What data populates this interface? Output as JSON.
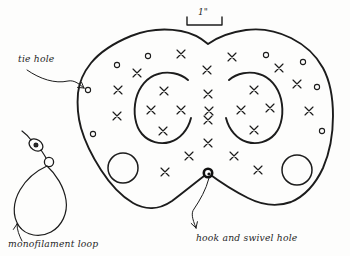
{
  "drawing": {
    "title": "Fishing board / planer board layout sketch",
    "medium": "hand-drawn pencil line art",
    "background_color": "#fdfdfc",
    "ink_color": "#1c1c1c"
  },
  "scale": {
    "label": "1\"",
    "bar_length_px": 35,
    "meaning": "one inch reference bar"
  },
  "labels": [
    {
      "id": "tie-hole",
      "text": "tie hole",
      "x": 18,
      "y": 62
    },
    {
      "id": "monofilament-loop",
      "text": "monofilament loop",
      "x": 8,
      "y": 246
    },
    {
      "id": "hook-and-swivel-hole",
      "text": "hook and swivel hole",
      "x": 196,
      "y": 241
    }
  ],
  "features": {
    "board_outline": "irregular two-lobed blob with V-notch at top center and notch at bottom center",
    "inner_arcs": 2,
    "large_holes": 2,
    "tie_holes": 10,
    "x_marks": 31,
    "hook_swivel_hole": {
      "x": 208,
      "y": 173
    }
  },
  "tie_holes": [
    {
      "x": 88,
      "y": 90
    },
    {
      "x": 117,
      "y": 65
    },
    {
      "x": 148,
      "y": 56
    },
    {
      "x": 266,
      "y": 55
    },
    {
      "x": 303,
      "y": 62
    },
    {
      "x": 317,
      "y": 87
    },
    {
      "x": 322,
      "y": 131
    },
    {
      "x": 93,
      "y": 134
    }
  ],
  "x_marks": [
    {
      "x": 181,
      "y": 54
    },
    {
      "x": 232,
      "y": 57
    },
    {
      "x": 137,
      "y": 73
    },
    {
      "x": 207,
      "y": 70
    },
    {
      "x": 279,
      "y": 68
    },
    {
      "x": 118,
      "y": 90
    },
    {
      "x": 164,
      "y": 91
    },
    {
      "x": 208,
      "y": 94
    },
    {
      "x": 254,
      "y": 90
    },
    {
      "x": 297,
      "y": 84
    },
    {
      "x": 151,
      "y": 110
    },
    {
      "x": 181,
      "y": 110
    },
    {
      "x": 209,
      "y": 111
    },
    {
      "x": 241,
      "y": 110
    },
    {
      "x": 270,
      "y": 108
    },
    {
      "x": 117,
      "y": 116
    },
    {
      "x": 309,
      "y": 111
    },
    {
      "x": 208,
      "y": 120
    },
    {
      "x": 163,
      "y": 131
    },
    {
      "x": 254,
      "y": 130
    },
    {
      "x": 208,
      "y": 143
    },
    {
      "x": 189,
      "y": 156
    },
    {
      "x": 234,
      "y": 156
    },
    {
      "x": 165,
      "y": 172
    },
    {
      "x": 258,
      "y": 170
    }
  ],
  "large_holes": [
    {
      "id": "left-hole",
      "x": 123,
      "y": 168,
      "r": 15
    },
    {
      "id": "right-hole",
      "x": 297,
      "y": 170,
      "r": 15
    }
  ],
  "monofilament_rig": {
    "swivel_bead": {
      "x": 36,
      "y": 145,
      "rx": 7,
      "ry": 5
    },
    "ring": {
      "x": 48,
      "y": 161,
      "r": 5
    },
    "loop": {
      "cx": 40,
      "cy": 196,
      "rx": 26,
      "ry": 33
    }
  }
}
